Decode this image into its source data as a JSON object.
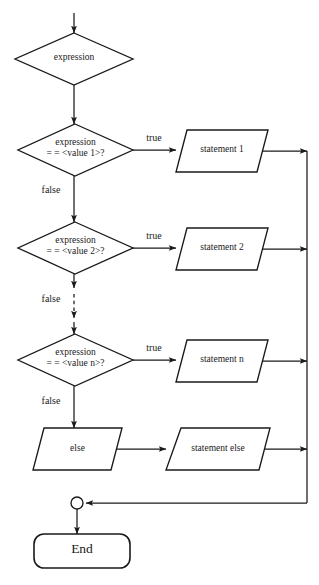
{
  "diagram": {
    "type": "flowchart",
    "colors": {
      "stroke": "#1a1a1a",
      "text": "#1a1a1a",
      "background": "#ffffff"
    },
    "entry": {
      "name": "entry-arrow",
      "label": ""
    },
    "nodes": [
      {
        "id": "expression",
        "shape": "decision",
        "label": "expression"
      },
      {
        "id": "case1",
        "shape": "decision",
        "label_line1": "expression",
        "label_line2": "= = <value 1>?"
      },
      {
        "id": "statement1",
        "shape": "parallelogram",
        "label": "statement 1"
      },
      {
        "id": "case2",
        "shape": "decision",
        "label_line1": "expression",
        "label_line2": "= = <value 2>?"
      },
      {
        "id": "statement2",
        "shape": "parallelogram",
        "label": "statement 2"
      },
      {
        "id": "casen",
        "shape": "decision",
        "label_line1": "expression",
        "label_line2": "= = <value n>?"
      },
      {
        "id": "statementn",
        "shape": "parallelogram",
        "label": "statement n"
      },
      {
        "id": "else",
        "shape": "parallelogram",
        "label": "else"
      },
      {
        "id": "statementelse",
        "shape": "parallelogram",
        "label": "statement else"
      },
      {
        "id": "merge",
        "shape": "connector-circle",
        "label": ""
      },
      {
        "id": "end",
        "shape": "terminator",
        "label": "End"
      }
    ],
    "edge_labels": {
      "true_1": "true",
      "false_1": "false",
      "true_2": "true",
      "false_2": "false",
      "true_n": "true",
      "false_n": "false"
    },
    "ellipsis_edge": {
      "name": "dashed-continuation",
      "style": "dashed",
      "meaning": "additional cases omitted"
    }
  }
}
